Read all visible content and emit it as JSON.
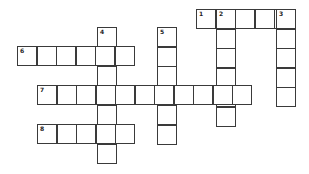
{
  "puzzle": {
    "type": "crossword",
    "cell_size": 19.5,
    "border_color": "#3a3a3a",
    "background": "#ffffff",
    "words": [
      {
        "number": "1",
        "direction": "across",
        "x": 196,
        "y": 9,
        "length": 5
      },
      {
        "number": "2",
        "direction": "down",
        "x": 216,
        "y": 9,
        "length": 6
      },
      {
        "number": "3",
        "direction": "down",
        "x": 276,
        "y": 9,
        "length": 5
      },
      {
        "number": "4",
        "direction": "down",
        "x": 97,
        "y": 27,
        "length": 7
      },
      {
        "number": "5",
        "direction": "down",
        "x": 157,
        "y": 27,
        "length": 6
      },
      {
        "number": "6",
        "direction": "across",
        "x": 17,
        "y": 46,
        "length": 6
      },
      {
        "number": "7",
        "direction": "across",
        "x": 37,
        "y": 85,
        "length": 11
      },
      {
        "number": "8",
        "direction": "across",
        "x": 37,
        "y": 124,
        "length": 5
      }
    ]
  }
}
